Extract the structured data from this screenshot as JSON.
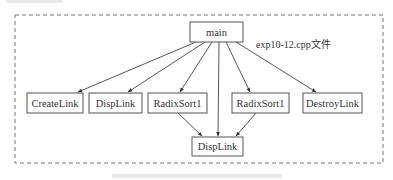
{
  "diagram": {
    "type": "call-graph",
    "container_label": "exp10-12.cpp文件",
    "nodes": [
      {
        "id": "main",
        "label": "main"
      },
      {
        "id": "createlink",
        "label": "CreateLink"
      },
      {
        "id": "displink1",
        "label": "DispLink"
      },
      {
        "id": "radixsort1a",
        "label": "RadixSort1"
      },
      {
        "id": "radixsort1b",
        "label": "RadixSort1"
      },
      {
        "id": "destroylink",
        "label": "DestroyLink"
      },
      {
        "id": "displink2",
        "label": "DispLink"
      }
    ],
    "edges": [
      {
        "from": "main",
        "to": "createlink"
      },
      {
        "from": "main",
        "to": "displink1"
      },
      {
        "from": "main",
        "to": "radixsort1a"
      },
      {
        "from": "main",
        "to": "displink2"
      },
      {
        "from": "main",
        "to": "radixsort1b"
      },
      {
        "from": "main",
        "to": "destroylink"
      },
      {
        "from": "radixsort1a",
        "to": "displink2"
      },
      {
        "from": "radixsort1b",
        "to": "displink2"
      }
    ]
  }
}
